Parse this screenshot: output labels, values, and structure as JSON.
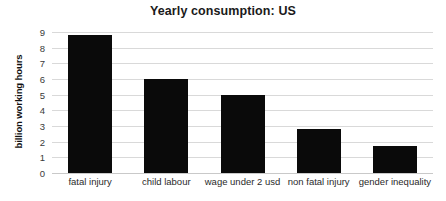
{
  "chart_data": {
    "type": "bar",
    "title": "Yearly consumption: US",
    "xlabel": "",
    "ylabel": "billion working hours",
    "categories": [
      "fatal injury",
      "child labour",
      "wage under 2 usd",
      "non fatal injury",
      "gender inequality"
    ],
    "values": [
      8.8,
      6.0,
      5.0,
      2.8,
      1.7
    ],
    "ylim": [
      0,
      9
    ],
    "yticks": [
      0,
      1,
      2,
      3,
      4,
      5,
      6,
      7,
      8,
      9
    ],
    "ytick_labels": [
      "0",
      "1",
      "2",
      "3",
      "4",
      "5",
      "6",
      "7",
      "8",
      "9"
    ],
    "grid": true,
    "legend": false,
    "bar_color": "#0a0a0a",
    "grid_color": "#d9d9d9",
    "background_color": "#ffffff",
    "title_color": "#1a1a1a"
  }
}
